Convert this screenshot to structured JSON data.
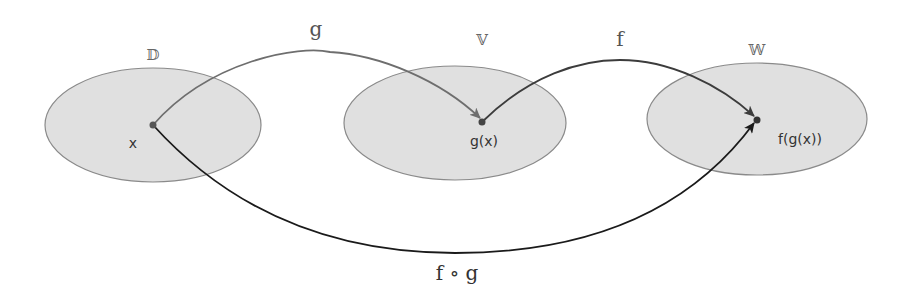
{
  "diagram": {
    "colors": {
      "set_fill": "#e0e0e0",
      "set_stroke": "#8a8a8a",
      "arrow_g": "#6e6e6e",
      "arrow_f": "#3c3c3c",
      "arrow_fog": "#1a1a1a",
      "point": "#555555"
    },
    "sets": [
      {
        "id": "D",
        "label": "𝔻",
        "cx": 153,
        "cy": 125,
        "rx": 108,
        "ry": 57
      },
      {
        "id": "V",
        "label": "𝕍",
        "cx": 455,
        "cy": 123,
        "rx": 111,
        "ry": 57
      },
      {
        "id": "W",
        "label": "𝕎",
        "cx": 757,
        "cy": 119,
        "rx": 110,
        "ry": 56
      }
    ],
    "points": [
      {
        "id": "x",
        "label": "x",
        "x": 153,
        "y": 125
      },
      {
        "id": "gx",
        "label": "g(x)",
        "x": 482,
        "y": 122
      },
      {
        "id": "fgx",
        "label": "f(g(x))",
        "x": 757,
        "y": 120
      }
    ],
    "arrows": [
      {
        "id": "g",
        "label": "g",
        "from": "x",
        "to": "gx"
      },
      {
        "id": "f",
        "label": "f",
        "from": "gx",
        "to": "fgx"
      },
      {
        "id": "fog",
        "label": "f ∘ g",
        "from": "x",
        "to": "fgx"
      }
    ]
  }
}
